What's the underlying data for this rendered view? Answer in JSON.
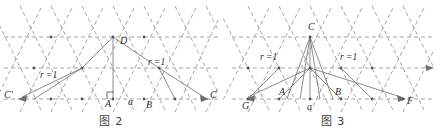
{
  "page": {
    "background": "#ffffff",
    "ink_color": "#8f8f8f",
    "label_color": "#2f2f2f",
    "width": 444,
    "height": 140
  },
  "figures": [
    {
      "id": "figure-2",
      "caption": "图 2",
      "lattice": {
        "type": "triangular",
        "rows": 3,
        "spacing_x": 31,
        "spacing_y": 31,
        "grid_style": "dashed"
      },
      "labels": [
        {
          "name": "C-prime",
          "text": "C'",
          "x": 4,
          "y": 98
        },
        {
          "name": "A",
          "text": "A",
          "x": 105,
          "y": 105
        },
        {
          "name": "a",
          "text": "a",
          "x": 128,
          "y": 103
        },
        {
          "name": "B",
          "text": "B",
          "x": 146,
          "y": 106
        },
        {
          "name": "C",
          "text": "C",
          "x": 210,
          "y": 98
        },
        {
          "name": "D",
          "text": "D",
          "x": 122,
          "y": 43
        },
        {
          "name": "r-left",
          "text": "r =1",
          "x": 40,
          "y": 77
        },
        {
          "name": "r-right",
          "text": "r =1",
          "x": 148,
          "y": 64
        }
      ],
      "markers": [
        {
          "name": "right-angle-at-A",
          "x": 113,
          "y": 92
        }
      ],
      "construction_points": {
        "A": [
          113,
          99
        ],
        "B": [
          144,
          99
        ],
        "D": [
          113,
          37
        ],
        "C_left": [
          20,
          99
        ],
        "C_right": [
          206,
          99
        ],
        "P_left": [
          82,
          68
        ],
        "P_right": [
          159,
          68
        ]
      }
    },
    {
      "id": "figure-3",
      "caption": "图 3",
      "lattice": {
        "type": "triangular",
        "rows": 3,
        "spacing_x": 31,
        "spacing_y": 31,
        "grid_style": "dashed"
      },
      "labels": [
        {
          "name": "G",
          "text": "G",
          "x": 20,
          "y": 108
        },
        {
          "name": "A",
          "text": "A",
          "x": 58,
          "y": 95
        },
        {
          "name": "a",
          "text": "a",
          "x": 88,
          "y": 108
        },
        {
          "name": "B",
          "text": "B",
          "x": 116,
          "y": 95
        },
        {
          "name": "F",
          "text": "F",
          "x": 182,
          "y": 104
        },
        {
          "name": "C",
          "text": "C",
          "x": 89,
          "y": 22
        },
        {
          "name": "r-left",
          "text": "r =1",
          "x": 40,
          "y": 53
        },
        {
          "name": "r-right",
          "text": "r =1",
          "x": 116,
          "y": 53
        }
      ],
      "construction_points": {
        "C": [
          88,
          37
        ],
        "M": [
          88,
          68
        ],
        "A": [
          65,
          99
        ],
        "B": [
          111,
          99
        ],
        "G": [
          26,
          99
        ],
        "F": [
          181,
          99
        ]
      }
    }
  ]
}
